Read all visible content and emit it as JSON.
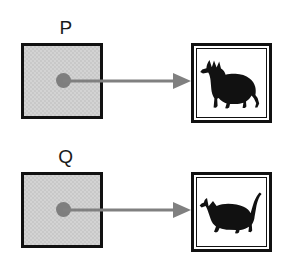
{
  "diagram": {
    "background_color": "#ffffff",
    "square_fill_color": "#d3d3d3",
    "square_border_color": "#111111",
    "dot_color": "#7e7e7e",
    "arrow_color": "#808080",
    "silhouette_color": "#111111",
    "rows": [
      {
        "label": "P",
        "source_name": "gray-square-p",
        "dot_name": "center-dot-p",
        "arrow_name": "arrow-p-to-dog",
        "target_label": "dog",
        "target_icon": "dog-silhouette-icon"
      },
      {
        "label": "Q",
        "source_name": "gray-square-q",
        "dot_name": "center-dot-q",
        "arrow_name": "arrow-q-to-cat",
        "target_label": "cat",
        "target_icon": "cat-silhouette-icon"
      }
    ]
  }
}
